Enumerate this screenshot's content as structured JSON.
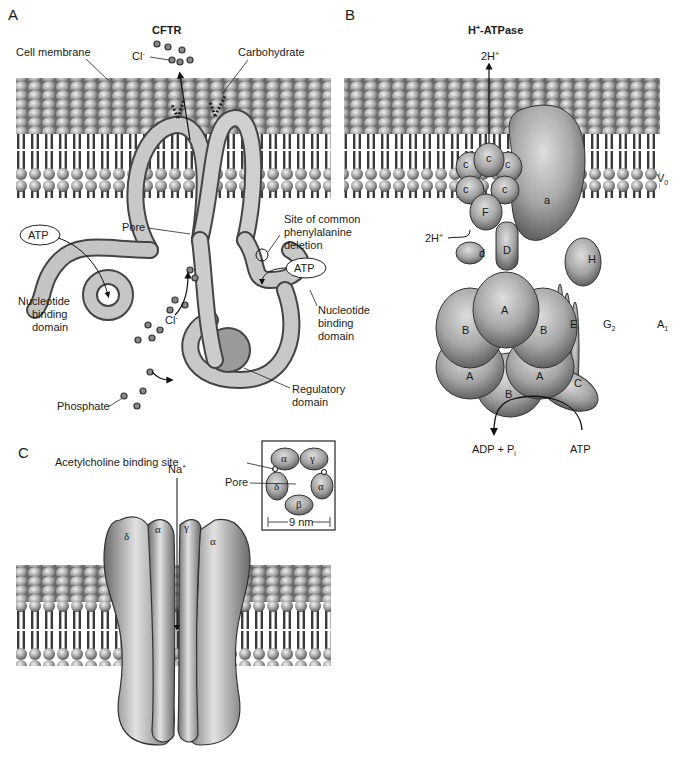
{
  "panels": {
    "A": {
      "letter": "A",
      "title": "CFTR",
      "labels": {
        "cell_membrane": "Cell membrane",
        "chloride": "Cl",
        "chloride_sup": "-",
        "carbohydrate": "Carbohydrate",
        "pore": "Pore",
        "atp_left": "ATP",
        "atp_right": "ATP",
        "site_line1": "Site of common",
        "site_line2": "phenylalanine",
        "site_line3": "deletion",
        "nbd_left_1": "Nucleotide",
        "nbd_left_2": "binding",
        "nbd_left_3": "domain",
        "nbd_right_1": "Nucleotide",
        "nbd_right_2": "binding",
        "nbd_right_3": "domain",
        "chloride_lower": "Cl",
        "regulatory_1": "Regulatory",
        "regulatory_2": "domain",
        "phosphate": "Phosphate"
      }
    },
    "B": {
      "letter": "B",
      "title": "H",
      "title_sup": "+",
      "title_rest": "-ATPase",
      "labels": {
        "proton_out": "2H",
        "proton_out_sup": "+",
        "proton_in": "2H",
        "proton_in_sup": "+",
        "v0": "V",
        "v0_sub": "0",
        "a1": "A",
        "a1_sub": "1",
        "g2": "G",
        "g2_sub": "2",
        "adp": "ADP + P",
        "adp_sub": "i",
        "atp": "ATP"
      },
      "subunits": {
        "c": "c",
        "a": "a",
        "F": "F",
        "d": "d",
        "D": "D",
        "H": "H",
        "A": "A",
        "B": "B",
        "E": "E",
        "C": "C"
      }
    },
    "C": {
      "letter": "C",
      "labels": {
        "sodium": "Na",
        "sodium_sup": "+",
        "ach_site": "Acetylcholine binding site",
        "pore": "Pore",
        "scale": "9 nm"
      },
      "subunits_side": [
        "δ",
        "α",
        "γ",
        "α"
      ],
      "subunits_inset": {
        "top_left": "α",
        "top_right": "γ",
        "left": "δ",
        "right": "α",
        "bottom": "β"
      }
    }
  },
  "colors": {
    "protein_light": "#c9c9c9",
    "protein_dark": "#6e6e6e",
    "membrane_head": "#9a9a9a",
    "membrane_surface": "#6a6a6a"
  }
}
